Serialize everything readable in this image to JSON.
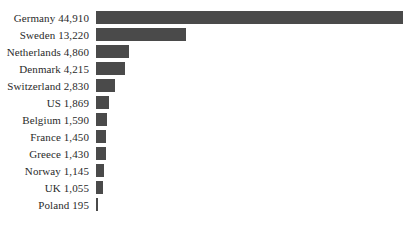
{
  "chart_data": {
    "type": "bar",
    "orientation": "horizontal",
    "title": "",
    "subtitle": "",
    "xlabel": "",
    "ylabel": "",
    "grid": false,
    "legend": null,
    "axis_visible": false,
    "tick_labels": [],
    "xlim": [
      0,
      44910
    ],
    "bar_color": "#4a4a4a",
    "background_color": "#ffffff",
    "label_color": "#2a2a2a",
    "label_format": "{category} {value}",
    "categories": [
      "Germany",
      "Sweden",
      "Netherlands",
      "Denmark",
      "Switzerland",
      "US",
      "Belgium",
      "France",
      "Greece",
      "Norway",
      "UK",
      "Poland"
    ],
    "values": [
      44910,
      13220,
      4860,
      4215,
      2830,
      1869,
      1590,
      1450,
      1430,
      1145,
      1055,
      195
    ],
    "value_labels": [
      "44,910",
      "13,220",
      "4,860",
      "4,215",
      "2,830",
      "1,869",
      "1,590",
      "1,450",
      "1,430",
      "1,145",
      "1,055",
      "195"
    ]
  },
  "rows": [
    {
      "label": "Germany 44,910",
      "category": "Germany",
      "value": 44910
    },
    {
      "label": "Sweden 13,220",
      "category": "Sweden",
      "value": 13220
    },
    {
      "label": "Netherlands 4,860",
      "category": "Netherlands",
      "value": 4860
    },
    {
      "label": "Denmark 4,215",
      "category": "Denmark",
      "value": 4215
    },
    {
      "label": "Switzerland 2,830",
      "category": "Switzerland",
      "value": 2830
    },
    {
      "label": "US 1,869",
      "category": "US",
      "value": 1869
    },
    {
      "label": "Belgium 1,590",
      "category": "Belgium",
      "value": 1590
    },
    {
      "label": "France 1,450",
      "category": "France",
      "value": 1450
    },
    {
      "label": "Greece 1,430",
      "category": "Greece",
      "value": 1430
    },
    {
      "label": "Norway 1,145",
      "category": "Norway",
      "value": 1145
    },
    {
      "label": "UK 1,055",
      "category": "UK",
      "value": 1055
    },
    {
      "label": "Poland 195",
      "category": "Poland",
      "value": 195
    }
  ]
}
